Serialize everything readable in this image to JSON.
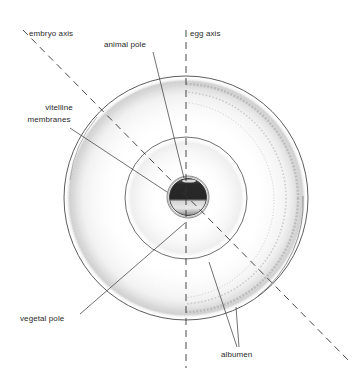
{
  "diagram": {
    "type": "egg cross-section (amphibian/bird egg orientation)",
    "colors": {
      "line": "#4a4a4a",
      "yolk_dark": "#262626",
      "yolk_light": "#d8d8d8",
      "albumen_stipple": "#bdbdbd",
      "background": "#ffffff"
    },
    "labels": {
      "embryo_axis": "embryo axis",
      "egg_axis": "egg axis",
      "animal_pole": "animal pole",
      "vitelline_membranes_line1": "vitelline",
      "vitelline_membranes_line2": "membranes",
      "vegetal_pole": "vegetal pole",
      "albumen": "albumen"
    }
  }
}
